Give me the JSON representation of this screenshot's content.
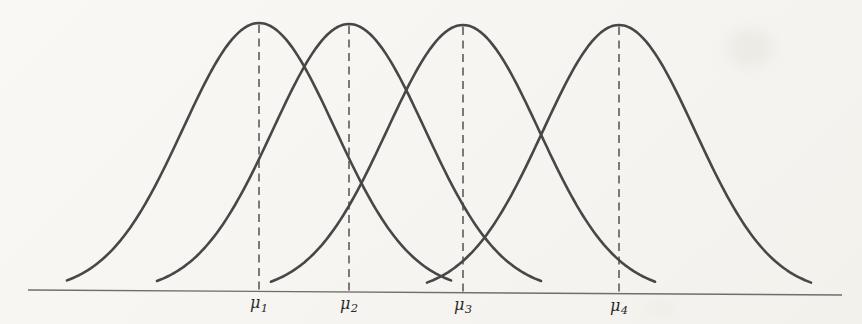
{
  "figure": {
    "kind": "statistics-textbook-figure"
  },
  "colors": {
    "background": "#f7f5f1",
    "curve": "#474747",
    "axis": "#6e6e6e",
    "dash": "#474747",
    "label": "#2b2b2b",
    "smudge": "#c9c6be"
  },
  "chart_data": {
    "type": "line",
    "title": "",
    "xlabel": "",
    "ylabel": "",
    "grid": false,
    "legend": false,
    "x_axis": {
      "x1": 28,
      "y1": 290,
      "x2": 842,
      "y2": 295,
      "ticks": false,
      "numeric_labels": false
    },
    "x_tick_labels": [
      "μ1",
      "μ2",
      "μ3",
      "μ4"
    ],
    "sigma_px": 76,
    "half_width_px": 192,
    "curve_stroke_width": 2.6,
    "axis_stroke_width": 1.4,
    "dash_stroke_width": 1.4,
    "dash_pattern": "8 5.5",
    "label_font_size": 16,
    "label_sub_font_size": 11.5,
    "label_offset_y": 17,
    "series": [
      {
        "name": "distribution-1",
        "mean_px": 259,
        "peak_y_px": 23,
        "label_base": "μ",
        "label_sub": "1"
      },
      {
        "name": "distribution-2",
        "mean_px": 349,
        "peak_y_px": 24,
        "label_base": "μ",
        "label_sub": "2"
      },
      {
        "name": "distribution-3",
        "mean_px": 463,
        "peak_y_px": 25,
        "label_base": "μ",
        "label_sub": "3"
      },
      {
        "name": "distribution-4",
        "mean_px": 619,
        "peak_y_px": 25,
        "label_base": "μ",
        "label_sub": "4"
      }
    ],
    "scan_artifacts": [
      {
        "cx": 750,
        "cy": 48,
        "rx": 24,
        "ry": 20,
        "opacity": 0.18
      },
      {
        "cx": 660,
        "cy": 308,
        "rx": 18,
        "ry": 8,
        "opacity": 0.1
      }
    ]
  }
}
